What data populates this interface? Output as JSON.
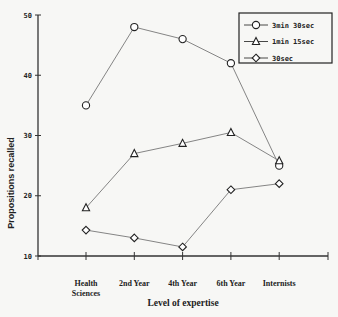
{
  "chart_data": {
    "type": "line",
    "title": "",
    "xlabel": "Level of expertise",
    "ylabel": "Propositions recalled",
    "categories": [
      "Health Sciences",
      "2nd Year",
      "4th Year",
      "6th Year",
      "Internists"
    ],
    "category_lines": [
      [
        "Health",
        "Sciences"
      ],
      [
        "2nd Year"
      ],
      [
        "4th Year"
      ],
      [
        "6th Year"
      ],
      [
        "Internists"
      ]
    ],
    "ylim": [
      10,
      50
    ],
    "yticks": [
      10,
      20,
      30,
      40,
      50
    ],
    "grid": false,
    "legend_position": "top-right",
    "series": [
      {
        "name": "3min 30sec",
        "marker": "circle",
        "values": [
          35,
          48,
          46,
          42,
          25
        ]
      },
      {
        "name": "1min 15sec",
        "marker": "triangle",
        "values": [
          18,
          27,
          28.7,
          30.5,
          25.8
        ]
      },
      {
        "name": "30sec",
        "marker": "diamond",
        "values": [
          14.3,
          13,
          11.5,
          21,
          22
        ]
      }
    ]
  },
  "colors": {
    "line": "#777777",
    "axis": "#333333",
    "marker_stroke": "#222222",
    "background": "#f7f7f5"
  }
}
